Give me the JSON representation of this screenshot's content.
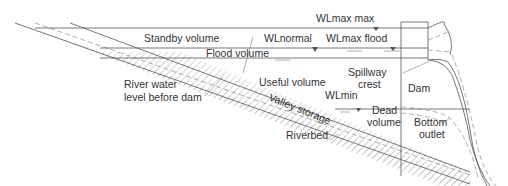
{
  "diagram": {
    "type": "reservoir-dam-cross-section",
    "colors": {
      "line": "#555555",
      "text": "#333333",
      "hatch": "#888888",
      "background": "#ffffff"
    },
    "labels": {
      "wl_max_max": "WLmax max",
      "wl_normal": "WLnormal",
      "wl_max_flood": "WLmax flood",
      "standby_volume": "Standby volume",
      "flood_volume": "Flood volume",
      "spillway_crest_1": "Spillway",
      "spillway_crest_2": "crest",
      "useful_volume": "Useful volume",
      "river_water_1": "River water",
      "river_water_2": "level before dam",
      "wl_min": "WLmin",
      "dam": "Dam",
      "dead_volume_1": "Dead",
      "dead_volume_2": "volume",
      "valley_storage": "Valley storage",
      "bottom_outlet_1": "Bottom",
      "bottom_outlet_2": "outlet",
      "riverbed": "Riverbed"
    }
  }
}
